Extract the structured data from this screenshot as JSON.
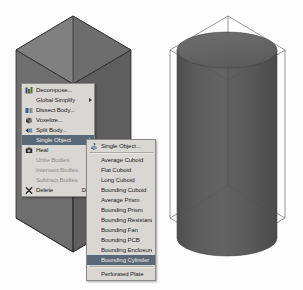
{
  "app": {
    "scene_description": "3D CAD viewport showing a hexagonal prism body on the left and a shaded bounding cylinder preview on the right",
    "background_color": "#fdfdfd"
  },
  "viewport": {
    "left_object": {
      "name": "hexagonal-prism-body",
      "fill_top": "#7c7c7c",
      "fill_left": "#6e6e6e",
      "fill_right": "#606060",
      "edge_color": "#2b2b2b"
    },
    "right_object": {
      "name": "bounding-cylinder-preview",
      "cylinder_fill": "#5a5a5a",
      "cylinder_top_fill": "#6a6a6a",
      "wireframe_color": "#5a5a5a"
    }
  },
  "context_menu": {
    "name": "body-context-menu",
    "items": [
      {
        "label": "Decompose...",
        "icon": "decompose-icon",
        "accel": "",
        "state": "normal",
        "submenu": false
      },
      {
        "label": "Global Simplify",
        "icon": "",
        "accel": "",
        "state": "normal",
        "submenu": true
      },
      {
        "label": "Dissect Body...",
        "icon": "dissect-icon",
        "accel": "",
        "state": "normal",
        "submenu": false
      },
      {
        "label": "Voxelize...",
        "icon": "voxelize-icon",
        "accel": "",
        "state": "normal",
        "submenu": false
      },
      {
        "label": "Split Body...",
        "icon": "split-body-icon",
        "accel": "",
        "state": "normal",
        "submenu": false
      },
      {
        "label": "Single Object",
        "icon": "",
        "accel": "",
        "state": "highlight",
        "submenu": true
      },
      {
        "label": "Heal",
        "icon": "heal-icon",
        "accel": "",
        "state": "normal",
        "submenu": false
      },
      {
        "label": "Unite Bodies",
        "icon": "",
        "accel": "",
        "state": "disabled",
        "submenu": false
      },
      {
        "label": "Intersect Bodies",
        "icon": "",
        "accel": "",
        "state": "disabled",
        "submenu": false
      },
      {
        "label": "Subtract Bodies",
        "icon": "",
        "accel": "",
        "state": "disabled",
        "submenu": false
      },
      {
        "label": "Delete",
        "icon": "delete-icon",
        "accel": "Del",
        "state": "normal",
        "submenu": false
      }
    ]
  },
  "submenu": {
    "name": "single-object-submenu",
    "items": [
      {
        "label": "Single Object...",
        "icon": "single-object-icon",
        "state": "normal"
      },
      {
        "label": "Average Cuboid",
        "icon": "",
        "state": "normal"
      },
      {
        "label": "Flat Cuboid",
        "icon": "",
        "state": "normal"
      },
      {
        "label": "Long Cuboid",
        "icon": "",
        "state": "normal"
      },
      {
        "label": "Bounding Cuboid",
        "icon": "",
        "state": "normal"
      },
      {
        "label": "Average Prism",
        "icon": "",
        "state": "normal"
      },
      {
        "label": "Bounding Prism",
        "icon": "",
        "state": "normal"
      },
      {
        "label": "Bounding Resistance",
        "icon": "",
        "state": "normal"
      },
      {
        "label": "Bounding Fan",
        "icon": "",
        "state": "normal"
      },
      {
        "label": "Bounding PCB",
        "icon": "",
        "state": "normal"
      },
      {
        "label": "Bounding Enclosure",
        "icon": "",
        "state": "normal"
      },
      {
        "label": "Bounding Cylinder",
        "icon": "",
        "state": "highlight"
      },
      {
        "label": "Perforated Plate",
        "icon": "",
        "state": "normal"
      }
    ]
  },
  "colors": {
    "menu_background": "#d8d7d3",
    "menu_border": "#8a8a86",
    "highlight": "#5b6878",
    "highlight_text": "#e9e9e9",
    "disabled_text": "#8f8e8b",
    "text": "#1d1d1d"
  }
}
